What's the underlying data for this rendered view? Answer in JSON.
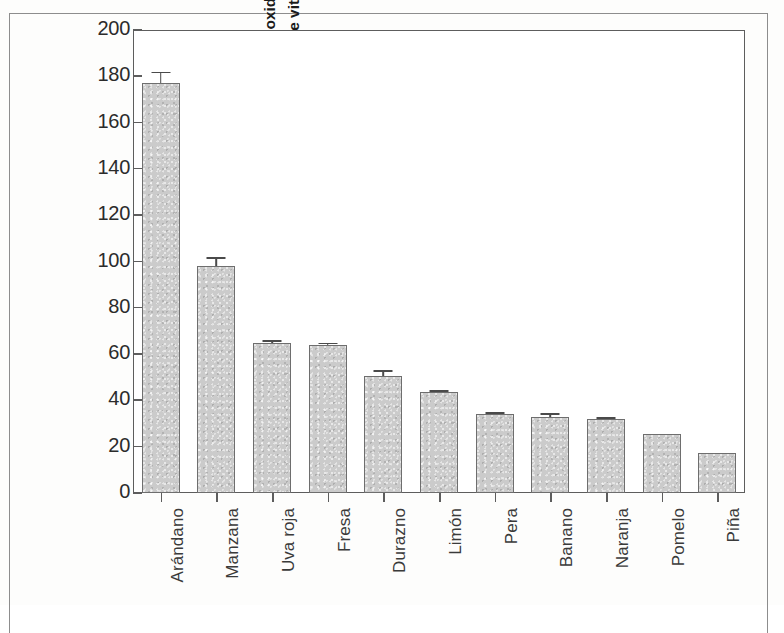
{
  "chart_data": {
    "type": "bar",
    "title": "",
    "xlabel": "",
    "ylabel": "Actividad antioxidante total (Equivalente en umol de vitamina C/g de fruta)",
    "ylabel_lines": [
      "Actividad antioxidante total",
      "(Equivalente en umol de vitamina C/g de fruta)"
    ],
    "categories": [
      "Arándano",
      "Manzana",
      "Uva roja",
      "Fresa",
      "Durazno",
      "Limón",
      "Pera",
      "Banano",
      "Naranja",
      "Pomelo",
      "Piña"
    ],
    "values": [
      177,
      98,
      65,
      64,
      50.5,
      43.5,
      34,
      33,
      32,
      25.5,
      17.5
    ],
    "errors": [
      5,
      4,
      1,
      1,
      2.5,
      1,
      1,
      1.5,
      0.8,
      0,
      0
    ],
    "ylim": [
      0,
      200
    ],
    "yticks": [
      0,
      20,
      40,
      60,
      80,
      100,
      120,
      140,
      160,
      180,
      200
    ],
    "ytick_labels": [
      "0",
      "20",
      "40",
      "60",
      "80",
      "100",
      "120",
      "140",
      "160",
      "180",
      "200"
    ],
    "grid": false,
    "legend": false,
    "bar_fill_color": "#cbcbcb",
    "bar_border_color": "#6e6e6e",
    "axis_color": "#5d5d5d",
    "text_color": "#2b2b2b"
  }
}
